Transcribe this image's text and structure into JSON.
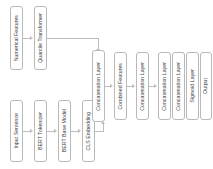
{
  "diagram": {
    "orientation": "left-to-right",
    "text_orientation": "vertical-rotated",
    "colors": {
      "background": "#ffffff",
      "node_border": "#b9b9b9",
      "node_fill": "#ffffff",
      "edge": "#bdbdbd",
      "text": "#3a3a3a"
    },
    "branches": {
      "numeric_branch_label": "Numerical feature branch",
      "text_branch_label": "Text feature branch"
    },
    "nodes": [
      {
        "id": "numerical_features",
        "label": "Numerical Features",
        "branch": "numeric"
      },
      {
        "id": "quantile_transformer",
        "label": "Quantile Transformer",
        "branch": "numeric"
      },
      {
        "id": "input_sentence",
        "label": "Input Sentence",
        "branch": "text"
      },
      {
        "id": "bert_tokenizer",
        "label": "BERT Tokenizer",
        "branch": "text"
      },
      {
        "id": "bert_base_model",
        "label": "BERT Base Model",
        "branch": "text"
      },
      {
        "id": "cls_embedding",
        "label": "CLS Embedding",
        "branch": "text"
      },
      {
        "id": "concatenation_layer_1",
        "label": "Concatenation Layer",
        "branch": "fusion"
      },
      {
        "id": "combined_features",
        "label": "Combined Features",
        "branch": "fusion"
      },
      {
        "id": "concatenation_layer_2",
        "label": "Concatenation Layer",
        "branch": "fusion"
      },
      {
        "id": "concatenation_layer_3",
        "label": "Concatenation Layer",
        "branch": "fusion"
      },
      {
        "id": "concatenation_layer_4",
        "label": "Concatenation Layer",
        "branch": "fusion"
      },
      {
        "id": "sigmoid_layer",
        "label": "Sigmoid Layer",
        "branch": "fusion"
      },
      {
        "id": "output",
        "label": "Output",
        "branch": "fusion"
      }
    ],
    "edges": [
      {
        "from": "numerical_features",
        "to": "quantile_transformer"
      },
      {
        "from": "quantile_transformer",
        "to": "concatenation_layer_1"
      },
      {
        "from": "input_sentence",
        "to": "bert_tokenizer"
      },
      {
        "from": "bert_tokenizer",
        "to": "bert_base_model"
      },
      {
        "from": "bert_base_model",
        "to": "cls_embedding"
      },
      {
        "from": "cls_embedding",
        "to": "concatenation_layer_1"
      },
      {
        "from": "concatenation_layer_1",
        "to": "combined_features"
      },
      {
        "from": "combined_features",
        "to": "concatenation_layer_2"
      },
      {
        "from": "concatenation_layer_2",
        "to": "concatenation_layer_3"
      },
      {
        "from": "concatenation_layer_3",
        "to": "concatenation_layer_4"
      },
      {
        "from": "concatenation_layer_4",
        "to": "sigmoid_layer"
      },
      {
        "from": "sigmoid_layer",
        "to": "output"
      }
    ]
  }
}
